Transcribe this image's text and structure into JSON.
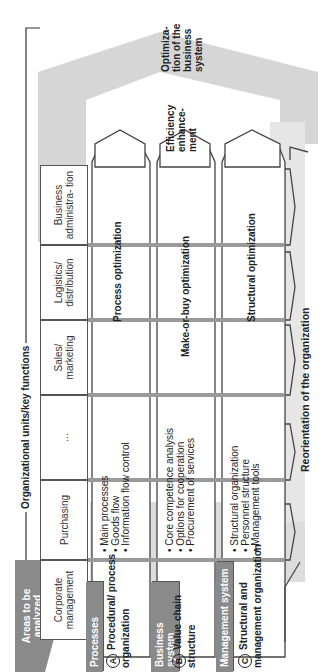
{
  "header": {
    "areas_label": "Areas to be analyzed",
    "org_units_title": "Organizational units/key functions"
  },
  "columns": [
    {
      "label": "Corporate management"
    },
    {
      "label": "Purchasing"
    },
    {
      "label": "..."
    },
    {
      "label": "Sales/ marketing"
    },
    {
      "label": "Logistics/ distribution"
    },
    {
      "label": "Business administra- tion"
    }
  ],
  "rows": [
    {
      "tab": "Processes",
      "letter": "A",
      "title": "Procedural/ process organization",
      "bullets": [
        "Main processes",
        "Goods flow",
        "Information flow control"
      ],
      "outcome": "Process optimization"
    },
    {
      "tab": "Business system",
      "letter": "B",
      "title": "Value chain structure",
      "bullets": [
        "Core competence analysis",
        "Options for cooperation",
        "Procurement of services"
      ],
      "outcome": "Make-or-buy optimization"
    },
    {
      "tab": "Management system",
      "letter": "C",
      "title": "Structural and management organization",
      "bullets": [
        "Structural organization",
        "Personnel structure",
        "Management tools"
      ],
      "outcome": "Structural optimization"
    }
  ],
  "right_labels": {
    "efficiency": "Efficiency enhance- ment",
    "optimization": "Optimiza- tion of the business system"
  },
  "bottom_label": "Reorientation of the organization",
  "colors": {
    "gray_band": "#d2d2d2",
    "tab_gray": "#8a8a8a",
    "line": "#444444"
  }
}
